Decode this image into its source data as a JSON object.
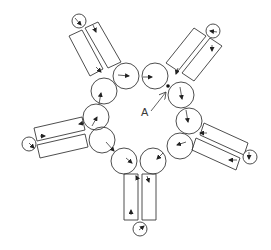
{
  "diagram": {
    "width": 271,
    "height": 250,
    "stroke_color": "#3a3a3a",
    "background": "#ffffff",
    "label": {
      "text": "A",
      "x": 141,
      "y": 116
    },
    "label_arrow": {
      "x1": 151,
      "y1": 111,
      "x2": 166,
      "y2": 92
    },
    "marker_dot": {
      "cx": 168,
      "cy": 86,
      "r": 1.8
    },
    "ring_rollers": [
      {
        "cx": 126,
        "cy": 76,
        "r": 13
      },
      {
        "cx": 155,
        "cy": 76,
        "r": 13
      },
      {
        "cx": 181,
        "cy": 95,
        "r": 13
      },
      {
        "cx": 189,
        "cy": 121,
        "r": 13
      },
      {
        "cx": 180,
        "cy": 146,
        "r": 13
      },
      {
        "cx": 153,
        "cy": 161,
        "r": 13
      },
      {
        "cx": 124,
        "cy": 161,
        "r": 13
      },
      {
        "cx": 102,
        "cy": 140,
        "r": 13
      },
      {
        "cx": 96,
        "cy": 117,
        "r": 13
      },
      {
        "cx": 104,
        "cy": 91,
        "r": 13
      }
    ],
    "arms": [
      {
        "name": "upper-left",
        "rects": [
          {
            "points": "69,36 82,30 103,69 90,76"
          },
          {
            "points": "85,28 98,22 121,62 108,68"
          }
        ],
        "end_circle": {
          "cx": 79,
          "cy": 21,
          "r": 7
        }
      },
      {
        "name": "upper-right",
        "rects": [
          {
            "points": "166,63 194,28 206,36 178,71"
          },
          {
            "points": "182,73 210,38 222,46 194,81"
          }
        ],
        "end_circle": {
          "cx": 213,
          "cy": 31,
          "r": 7
        }
      },
      {
        "name": "right",
        "rects": [
          {
            "points": "204,123 248,143 244,155 200,135"
          },
          {
            "points": "196,138 240,158 236,170 192,150"
          }
        ],
        "end_circle": {
          "cx": 250,
          "cy": 157,
          "r": 7
        }
      },
      {
        "name": "bottom",
        "rects": [
          {
            "points": "124,174 138,174 138,220 124,220"
          },
          {
            "points": "142,174 156,174 156,220 142,220"
          }
        ],
        "end_circle": {
          "cx": 140,
          "cy": 229,
          "r": 7
        }
      },
      {
        "name": "left",
        "rects": [
          {
            "points": "34,128 82,117 85,130 37,141"
          },
          {
            "points": "37,145 85,134 88,147 40,158"
          }
        ],
        "end_circle": {
          "cx": 29,
          "cy": 144,
          "r": 7
        }
      }
    ],
    "arrows": [
      {
        "x1": 118,
        "y1": 75,
        "x2": 129,
        "y2": 76
      },
      {
        "x1": 143,
        "y1": 77,
        "x2": 152,
        "y2": 77
      },
      {
        "x1": 180,
        "y1": 87,
        "x2": 182,
        "y2": 99
      },
      {
        "x1": 186,
        "y1": 110,
        "x2": 188,
        "y2": 122
      },
      {
        "x1": 186,
        "y1": 142,
        "x2": 177,
        "y2": 145
      },
      {
        "x1": 163,
        "y1": 153,
        "x2": 157,
        "y2": 159
      },
      {
        "x1": 126,
        "y1": 158,
        "x2": 132,
        "y2": 163
      },
      {
        "x1": 106,
        "y1": 142,
        "x2": 114,
        "y2": 151
      },
      {
        "x1": 92,
        "y1": 126,
        "x2": 97,
        "y2": 117
      },
      {
        "x1": 99,
        "y1": 104,
        "x2": 101,
        "y2": 93
      },
      {
        "x1": 96,
        "y1": 67,
        "x2": 101,
        "y2": 72
      },
      {
        "x1": 93,
        "y1": 25,
        "x2": 96,
        "y2": 32
      },
      {
        "x1": 75,
        "y1": 18,
        "x2": 81,
        "y2": 25
      },
      {
        "x1": 178,
        "y1": 68,
        "x2": 176,
        "y2": 74
      },
      {
        "x1": 212,
        "y1": 45,
        "x2": 212,
        "y2": 51
      },
      {
        "x1": 217,
        "y1": 32,
        "x2": 210,
        "y2": 31
      },
      {
        "x1": 207,
        "y1": 133,
        "x2": 200,
        "y2": 133
      },
      {
        "x1": 237,
        "y1": 160,
        "x2": 229,
        "y2": 160
      },
      {
        "x1": 249,
        "y1": 152,
        "x2": 249,
        "y2": 159
      },
      {
        "x1": 138,
        "y1": 180,
        "x2": 136,
        "y2": 176
      },
      {
        "x1": 147,
        "y1": 176,
        "x2": 149,
        "y2": 182
      },
      {
        "x1": 131,
        "y1": 215,
        "x2": 131,
        "y2": 210
      },
      {
        "x1": 139,
        "y1": 230,
        "x2": 144,
        "y2": 226
      },
      {
        "x1": 40,
        "y1": 136,
        "x2": 45,
        "y2": 136
      },
      {
        "x1": 29,
        "y1": 143,
        "x2": 34,
        "y2": 148
      },
      {
        "x1": 84,
        "y1": 123,
        "x2": 79,
        "y2": 124
      }
    ]
  }
}
